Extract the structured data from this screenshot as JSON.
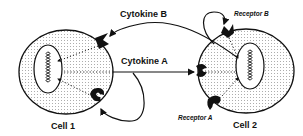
{
  "diagram": {
    "type": "cell-signaling",
    "labels": {
      "cytokine_b": "Cytokine B",
      "cytokine_a": "Cytokine A",
      "receptor_b": "Receptor B",
      "receptor_a": "Receptor A",
      "cell_1": "Cell 1",
      "cell_2": "Cell 2"
    },
    "nodes": [
      {
        "id": "cell1",
        "label": "Cell 1",
        "shape": "ellipse",
        "fill": "dotted",
        "contains": [
          "nucleus1",
          "receptorB_on_cell1",
          "receptorA_on_cell1"
        ]
      },
      {
        "id": "cell2",
        "label": "Cell 2",
        "shape": "ellipse",
        "fill": "dotted",
        "contains": [
          "nucleus2",
          "receptorB_on_cell2",
          "receptorA_on_cell2_left",
          "receptorA_on_cell2_bottom"
        ]
      },
      {
        "id": "nucleus1",
        "shape": "ellipse",
        "contains": "DNA helix"
      },
      {
        "id": "nucleus2",
        "shape": "ellipse",
        "contains": "DNA helix"
      }
    ],
    "edges": [
      {
        "from": "cell2",
        "to": "cell1-receptorB",
        "label": "Cytokine B",
        "style": "solid-arrow"
      },
      {
        "from": "cell1",
        "to": "cell2-receptorA",
        "label": "Cytokine A",
        "style": "solid-arrow"
      },
      {
        "from": "cell2",
        "to": "cell2-receptorB",
        "label": "autocrine loop",
        "style": "solid-arrow"
      },
      {
        "from": "cell1",
        "to": "cell1-receptorA",
        "label": "autocrine loop",
        "style": "solid-arrow"
      },
      {
        "from": "receptors",
        "to": "nucleus",
        "style": "dotted-arrow"
      }
    ],
    "colors": {
      "ink": "#111111",
      "background": "#ffffff",
      "dots": "#555555"
    }
  }
}
